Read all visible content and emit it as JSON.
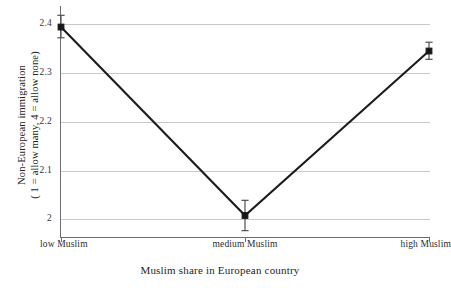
{
  "chart_data": {
    "type": "line",
    "title": "",
    "subtitle": "",
    "xlabel": "Muslim share in European country",
    "ylabel": "Non-European immigration ( 1 = allow many, 4 = allow none)",
    "ylabel_line1": "Non-European immigration",
    "ylabel_line2": "( 1 = allow many, 4 = allow none)",
    "categories": [
      "low Muslim",
      "medium Muslim",
      "high Muslim"
    ],
    "values": [
      2.393,
      2.008,
      2.344
    ],
    "error_low": [
      2.371,
      1.977,
      2.327
    ],
    "error_high": [
      2.417,
      2.039,
      2.362
    ],
    "error_margins": [
      0.023,
      0.031,
      0.018
    ],
    "ylim": [
      1.962,
      2.436
    ],
    "yticks": [
      2,
      2.1,
      2.2,
      2.3,
      2.4
    ],
    "ytick_labels": [
      "2",
      "2.1",
      "2.2",
      "2.3",
      "2.4"
    ],
    "xtick_labels": [
      "low Muslim",
      "medium Muslim",
      "high Muslim"
    ],
    "grid": "horizontal",
    "legend": "none",
    "marker": "square",
    "series": [
      {
        "name": "Non-European immigration",
        "values": [
          2.393,
          2.008,
          2.344
        ]
      }
    ],
    "colors": {
      "line": "#1c1c1e",
      "marker": "#17171a",
      "errorbar": "#4a4a4e",
      "gridline": "#c9c9cc",
      "axis": "#6e6e72",
      "text": "#231f20",
      "background": "#ffffff"
    }
  }
}
